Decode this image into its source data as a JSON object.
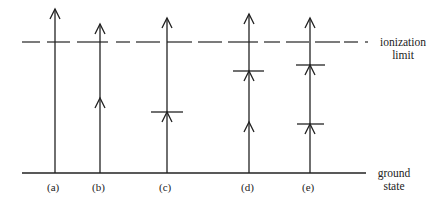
{
  "diagram": {
    "type": "energy-level diagram",
    "labels": {
      "ionization_limit": [
        "ionization",
        "limit"
      ],
      "ground_state": [
        "ground",
        "state"
      ]
    },
    "stroke_color": "#222222",
    "ground_y": 173,
    "ionization_y": 42,
    "columns": [
      {
        "label": "(a)",
        "x": 55,
        "top": 9,
        "mid_arrows": [],
        "levels": []
      },
      {
        "label": "(b)",
        "x": 100,
        "top": 24,
        "mid_arrows": [
          98
        ],
        "levels": []
      },
      {
        "label": "(c)",
        "x": 167,
        "top": 18,
        "mid_arrows": [],
        "levels": [
          {
            "y": 112,
            "x1": 151,
            "x2": 183
          }
        ]
      },
      {
        "label": "(d)",
        "x": 249,
        "top": 14,
        "mid_arrows": [
          122
        ],
        "levels": [
          {
            "y": 71,
            "x1": 233,
            "x2": 264
          }
        ]
      },
      {
        "label": "(e)",
        "x": 310,
        "top": 18,
        "mid_arrows": [],
        "levels": [
          {
            "y": 65,
            "x1": 296,
            "x2": 325
          },
          {
            "y": 124,
            "x1": 297,
            "x2": 324
          }
        ]
      }
    ]
  }
}
